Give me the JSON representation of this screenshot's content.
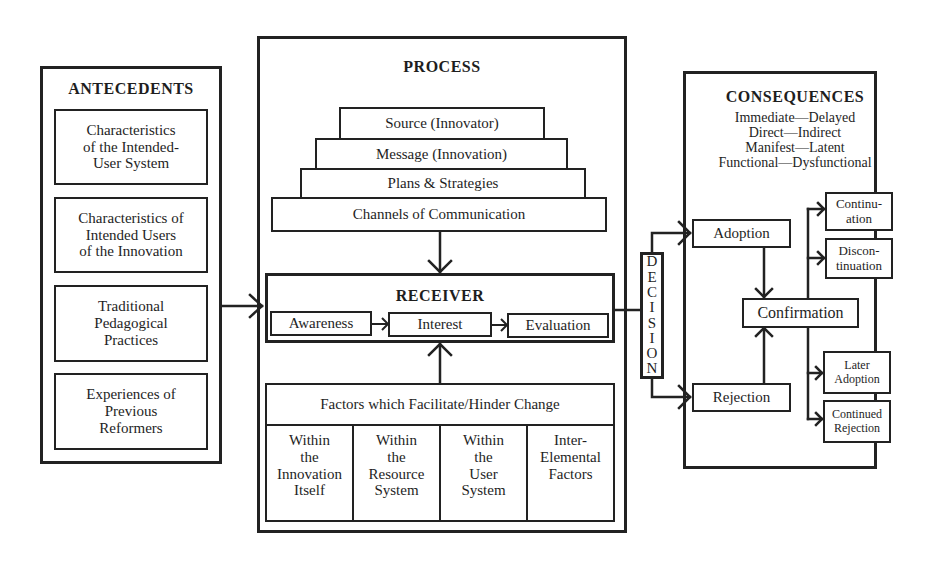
{
  "antecedents": {
    "title": "ANTECEDENTS",
    "items": [
      "Characteristics of the Intended-User System",
      "Characteristics of Intended Users of the Innovation",
      "Traditional Pedagogical Practices",
      "Experiences of Previous Reformers"
    ],
    "items_lines": [
      [
        "Characteristics",
        "of the Intended-",
        "User System"
      ],
      [
        "Characteristics of",
        "Intended Users",
        "of the Innovation"
      ],
      [
        "Traditional",
        "Pedagogical",
        "Practices"
      ],
      [
        "Experiences of",
        "Previous",
        "Reformers"
      ]
    ]
  },
  "process": {
    "title": "PROCESS",
    "pyramid": [
      "Source (Innovator)",
      "Message (Innovation)",
      "Plans & Strategies",
      "Channels of Communication"
    ],
    "receiver": {
      "title": "RECEIVER",
      "stages": [
        "Awareness",
        "Interest",
        "Evaluation"
      ]
    },
    "factors": {
      "title": "Factors which Facilitate/Hinder Change",
      "columns_lines": [
        [
          "Within",
          "the",
          "Innovation",
          "Itself"
        ],
        [
          "Within",
          "the",
          "Resource",
          "System"
        ],
        [
          "Within",
          "the",
          "User",
          "System"
        ],
        [
          "Inter-",
          "Elemental",
          "Factors"
        ]
      ]
    }
  },
  "decision": {
    "label": "DECISION",
    "letters": [
      "D",
      "E",
      "C",
      "I",
      "S",
      "I",
      "O",
      "N"
    ]
  },
  "consequences": {
    "title": "CONSEQUENCES",
    "pairs": [
      "Immediate—Delayed",
      "Direct—Indirect",
      "Manifest—Latent",
      "Functional—Dysfunctional"
    ],
    "adoption": "Adoption",
    "rejection": "Rejection",
    "confirmation": "Confirmation",
    "outcomes_lines": [
      [
        "Continu-",
        "ation"
      ],
      [
        "Discon-",
        "tinuation"
      ],
      [
        "Later",
        "Adoption"
      ],
      [
        "Continued",
        "Rejection"
      ]
    ]
  }
}
